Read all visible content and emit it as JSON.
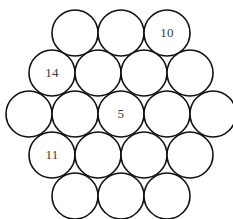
{
  "figure": {
    "background_color": "#ffffff",
    "circle_fill": "#ffffff",
    "circle_stroke": "#111111",
    "label_color": "#3b3b3b",
    "circle_radius": 23,
    "row_spacing": 40.5,
    "column_spacing": 46
  },
  "chart_data": {
    "type": "diagram",
    "rows": [
      3,
      4,
      5,
      4,
      3
    ],
    "total_circles": 19,
    "given_values": [
      {
        "row": 1,
        "position": 3,
        "value": "10"
      },
      {
        "row": 2,
        "position": 1,
        "value": "14"
      },
      {
        "row": 3,
        "position": 3,
        "value": "5"
      },
      {
        "row": 4,
        "position": 1,
        "value": "11"
      }
    ]
  },
  "grid": {
    "rows": [
      {
        "index": 1,
        "count": 3,
        "center_y": 33,
        "start_x": 75,
        "cells": [
          {
            "id": "r1c1",
            "label": "",
            "cx": 75,
            "cy": 33
          },
          {
            "id": "r1c2",
            "label": "",
            "cx": 121,
            "cy": 33
          },
          {
            "id": "r1c3",
            "label": "10",
            "cx": 167,
            "cy": 33
          }
        ]
      },
      {
        "index": 2,
        "count": 4,
        "center_y": 73,
        "start_x": 52,
        "cells": [
          {
            "id": "r2c1",
            "label": "14",
            "cx": 52,
            "cy": 73
          },
          {
            "id": "r2c2",
            "label": "",
            "cx": 98,
            "cy": 73
          },
          {
            "id": "r2c3",
            "label": "",
            "cx": 144,
            "cy": 73
          },
          {
            "id": "r2c4",
            "label": "",
            "cx": 190,
            "cy": 73
          }
        ]
      },
      {
        "index": 3,
        "count": 5,
        "center_y": 114,
        "start_x": 29,
        "cells": [
          {
            "id": "r3c1",
            "label": "",
            "cx": 29,
            "cy": 114
          },
          {
            "id": "r3c2",
            "label": "",
            "cx": 75,
            "cy": 114
          },
          {
            "id": "r3c3",
            "label": "5",
            "cx": 121,
            "cy": 114
          },
          {
            "id": "r3c4",
            "label": "",
            "cx": 167,
            "cy": 114
          },
          {
            "id": "r3c5",
            "label": "",
            "cx": 213,
            "cy": 114
          }
        ]
      },
      {
        "index": 4,
        "count": 4,
        "center_y": 155,
        "start_x": 52,
        "cells": [
          {
            "id": "r4c1",
            "label": "11",
            "cx": 52,
            "cy": 155
          },
          {
            "id": "r4c2",
            "label": "",
            "cx": 98,
            "cy": 155
          },
          {
            "id": "r4c3",
            "label": "",
            "cx": 144,
            "cy": 155
          },
          {
            "id": "r4c4",
            "label": "",
            "cx": 190,
            "cy": 155
          }
        ]
      },
      {
        "index": 5,
        "count": 3,
        "center_y": 196,
        "start_x": 75,
        "cells": [
          {
            "id": "r5c1",
            "label": "",
            "cx": 75,
            "cy": 196
          },
          {
            "id": "r5c2",
            "label": "",
            "cx": 121,
            "cy": 196
          },
          {
            "id": "r5c3",
            "label": "",
            "cx": 167,
            "cy": 196
          }
        ]
      }
    ]
  }
}
